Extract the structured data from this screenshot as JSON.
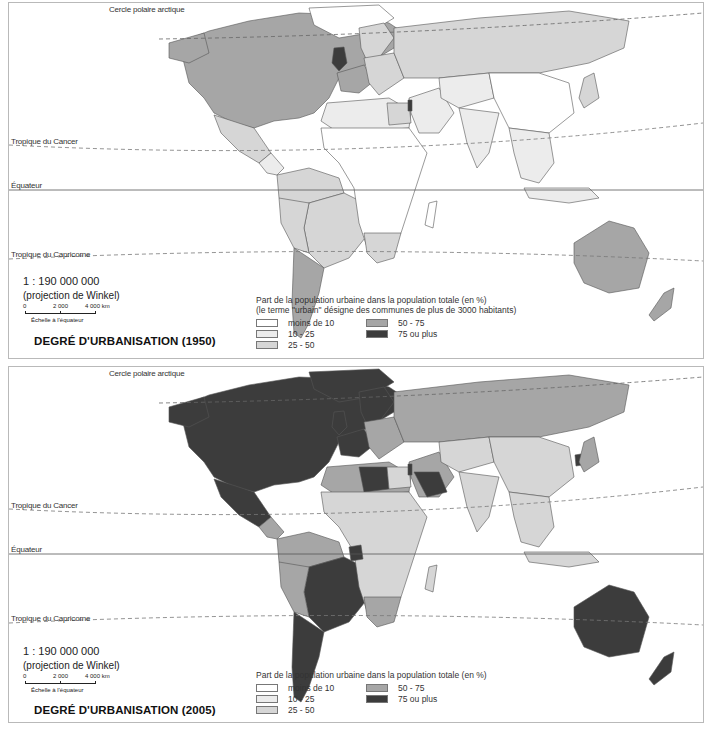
{
  "colors": {
    "lt10": "#ffffff",
    "c10_25": "#ececec",
    "c25_50": "#d6d6d6",
    "c50_75": "#a6a6a6",
    "c75p": "#3c3c3c",
    "border": "#555555",
    "ocean": "#ffffff"
  },
  "lines": {
    "arctic": "Cercle polaire arctique",
    "cancer": "Tropique du Cancer",
    "equator": "Équateur",
    "capricorn": "Tropique du Capricorne"
  },
  "panels": [
    {
      "id": "1950",
      "title": "DEGRÉ D'URBANISATION (1950)",
      "scale": {
        "ratio": "1 : 190 000 000",
        "projection": "(projection de Winkel)",
        "ticks": [
          "0",
          "2 000",
          "4 000 km"
        ],
        "caption": "Échelle à l'équateur"
      },
      "legend": {
        "title": "Part de la population urbaine dans la population totale (en %)",
        "subtitle": "(le terme \"urbain\" désigne des communes de plus de 3000 habitants)",
        "items": [
          {
            "label": "moins de 10",
            "class": "lt10"
          },
          {
            "label": "10 - 25",
            "class": "c10_25"
          },
          {
            "label": "25 - 50",
            "class": "c25_50"
          },
          {
            "label": "50 - 75",
            "class": "c50_75"
          },
          {
            "label": "75 ou plus",
            "class": "c75p"
          }
        ]
      },
      "regions": {
        "north_america": "c50_75",
        "greenland": "lt10",
        "mexico": "c25_50",
        "central_america": "c10_25",
        "south_america_north": "c25_50",
        "brazil": "c25_50",
        "southern_cone": "c50_75",
        "uk": "c75p",
        "western_europe": "c50_75",
        "scandinavia": "c25_50",
        "eastern_europe": "c25_50",
        "russia": "c25_50",
        "north_africa": "c10_25",
        "egypt": "c25_50",
        "africa": "lt10",
        "south_africa": "c25_50",
        "middle_east": "c10_25",
        "israel": "c75p",
        "central_asia": "c10_25",
        "china": "lt10",
        "india": "c10_25",
        "southeast_asia": "c10_25",
        "japan": "c25_50",
        "australia": "c50_75",
        "new_zealand": "c50_75",
        "madagascar": "lt10"
      }
    },
    {
      "id": "2005",
      "title": "DEGRÉ D'URBANISATION (2005)",
      "scale": {
        "ratio": "1 : 190 000 000",
        "projection": "(projection de Winkel)",
        "ticks": [
          "0",
          "2 000",
          "4 000 km"
        ],
        "caption": "Échelle à l'équateur"
      },
      "legend": {
        "title": "Part de la population urbaine dans la population totale (en %)",
        "subtitle": "",
        "items": [
          {
            "label": "moins de 10",
            "class": "lt10"
          },
          {
            "label": "10 - 25",
            "class": "c10_25"
          },
          {
            "label": "25 - 50",
            "class": "c25_50"
          },
          {
            "label": "50 - 75",
            "class": "c50_75"
          },
          {
            "label": "75 ou plus",
            "class": "c75p"
          }
        ]
      },
      "regions": {
        "north_america": "c75p",
        "greenland": "c75p",
        "mexico": "c75p",
        "central_america": "c50_75",
        "south_america_north": "c50_75",
        "brazil": "c75p",
        "southern_cone": "c75p",
        "uk": "c75p",
        "western_europe": "c75p",
        "scandinavia": "c75p",
        "eastern_europe": "c50_75",
        "russia": "c50_75",
        "north_africa": "c50_75",
        "egypt": "c25_50",
        "africa": "c25_50",
        "south_africa": "c50_75",
        "middle_east": "c50_75",
        "israel": "c75p",
        "central_asia": "c25_50",
        "china": "c25_50",
        "india": "c25_50",
        "southeast_asia": "c25_50",
        "japan": "c50_75",
        "australia": "c75p",
        "new_zealand": "c75p",
        "madagascar": "c25_50",
        "libya": "c75p",
        "saudi_arabia": "c75p",
        "south_korea": "c75p",
        "gabon": "c75p"
      }
    }
  ]
}
